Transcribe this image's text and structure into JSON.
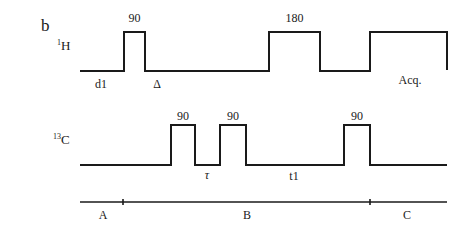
{
  "panel_label": "b",
  "channels": {
    "h1": {
      "label_sup": "1",
      "label_main": "H",
      "pulses": [
        {
          "label": "90"
        },
        {
          "label": "180"
        }
      ],
      "delays": {
        "d1": "d1",
        "delta": "Δ",
        "acq": "Acq."
      }
    },
    "c13": {
      "label_sup": "13",
      "label_main": "C",
      "pulses": [
        {
          "label": "90"
        },
        {
          "label": "90"
        },
        {
          "label": "90"
        }
      ],
      "delays": {
        "tau": "τ",
        "t1": "t1"
      }
    }
  },
  "timeline": {
    "segments": [
      {
        "label": "A"
      },
      {
        "label": "B"
      },
      {
        "label": "C"
      }
    ]
  },
  "colors": {
    "ink": "#1a1a1a",
    "background": "#ffffff"
  }
}
